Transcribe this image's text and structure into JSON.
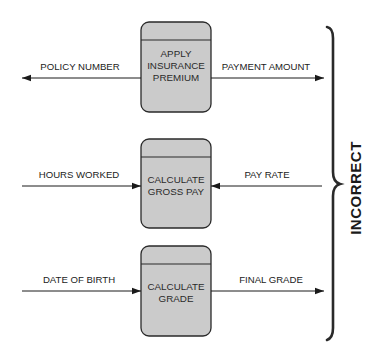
{
  "colors": {
    "box_fill": "#cbcbcb",
    "stroke": "#2a2a2a",
    "background": "#ffffff"
  },
  "processes": [
    {
      "label_lines": [
        "APPLY",
        "INSURANCE",
        "PREMIUM"
      ],
      "left_flow": {
        "label": "POLICY NUMBER",
        "direction": "out-left"
      },
      "right_flow": {
        "label": "PAYMENT AMOUNT",
        "direction": "out-right"
      }
    },
    {
      "label_lines": [
        "CALCULATE",
        "GROSS PAY"
      ],
      "left_flow": {
        "label": "HOURS WORKED",
        "direction": "in-from-left"
      },
      "right_flow": {
        "label": "PAY RATE",
        "direction": "in-from-right"
      }
    },
    {
      "label_lines": [
        "CALCULATE",
        "GRADE"
      ],
      "left_flow": {
        "label": "DATE OF BIRTH",
        "direction": "in-from-left"
      },
      "right_flow": {
        "label": "FINAL GRADE",
        "direction": "out-right"
      }
    }
  ],
  "bracket_label": "INCORRECT"
}
